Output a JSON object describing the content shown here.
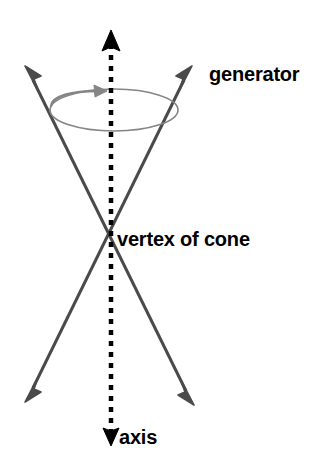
{
  "diagram": {
    "background_color": "#ffffff",
    "width": 334,
    "height": 463,
    "colors": {
      "axis": "#000000",
      "generator": "#4a4a4a",
      "circle": "#858585",
      "rotation_arrow": "#858585",
      "label_text": "#000000"
    },
    "labels": {
      "generator": "generator",
      "vertex": "vertex of cone",
      "axis": "axis"
    },
    "geometry": {
      "vertex": {
        "x": 110,
        "y": 240
      },
      "axis": {
        "style": "dashed",
        "x": 111,
        "top_arrow_tip_y": 31,
        "bottom_arrow_tip_y": 445,
        "dash_length": 5,
        "dash_gap": 6,
        "stroke_width": 4.5,
        "arrowheads": "both-ends"
      },
      "generator_lines": [
        {
          "name": "generator-line-a",
          "from": {
            "x": 27,
            "y": 68
          },
          "to": {
            "x": 192,
            "y": 403
          },
          "stroke_width": 3,
          "arrowheads": "both-ends"
        },
        {
          "name": "generator-line-b",
          "from": {
            "x": 190,
            "y": 68
          },
          "to": {
            "x": 27,
            "y": 400
          },
          "stroke_width": 3,
          "arrowheads": "both-ends"
        }
      ],
      "directrix_circle": {
        "center": {
          "x": 114,
          "y": 110
        },
        "rx": 64,
        "ry": 21,
        "stroke_width": 1.6
      },
      "rotation_arrow": {
        "description": "curved arrow along the top of the circle indicating rotation direction",
        "direction": "clockwise-to-the-right",
        "tip": {
          "x": 106,
          "y": 95
        }
      }
    }
  }
}
